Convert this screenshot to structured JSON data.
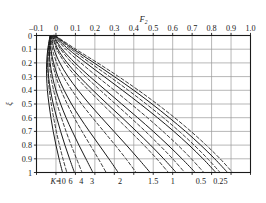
{
  "chart_data": {
    "type": "line",
    "title": "",
    "xlabel": "F2",
    "xlabel_display": "F",
    "xlabel_sub": "2",
    "ylabel": "ξ",
    "xlim": [
      -0.1,
      1.0
    ],
    "ylim": [
      0,
      1
    ],
    "y_inverted": true,
    "x_axis_position": "top",
    "grid": true,
    "legend": "none",
    "xticks": [
      -0.1,
      0,
      0.1,
      0.2,
      0.3,
      0.4,
      0.5,
      0.6,
      0.7,
      0.8,
      0.9,
      1.0
    ],
    "xtick_labels": [
      "-0.1",
      "0",
      "0.1",
      "0.2",
      "0.3",
      "0.4",
      "0.5",
      "0.6",
      "0.7",
      "0.8",
      "0.9",
      "1.0"
    ],
    "yticks": [
      0,
      0.1,
      0.2,
      0.3,
      0.4,
      0.5,
      0.6,
      0.7,
      0.8,
      0.9,
      1
    ],
    "ytick_labels": [
      "0",
      "0.1",
      "0.2",
      "0.3",
      "0.4",
      "0.5",
      "0.6",
      "0.7",
      "0.8",
      "0.9",
      "1"
    ],
    "curve_param_name": "K",
    "curve_param_prefix": "K=",
    "curve_labels": [
      "10",
      "6",
      "4",
      "3",
      "2",
      "1.5",
      "1",
      "0.5",
      "0.25"
    ],
    "curve_label_x": [
      0.03,
      0.075,
      0.13,
      0.185,
      0.33,
      0.5,
      0.6,
      0.745,
      0.845
    ],
    "linestyles": [
      "solid",
      "dashed"
    ],
    "series": [
      {
        "name": "K=10 solid",
        "style": "solid",
        "x": [
          -0.03,
          -0.042,
          -0.048,
          -0.048,
          -0.044,
          -0.036,
          -0.026,
          -0.014,
          0.0,
          0.016,
          0.034
        ],
        "y": [
          0.0,
          0.1,
          0.2,
          0.3,
          0.4,
          0.5,
          0.6,
          0.7,
          0.8,
          0.9,
          1.0
        ]
      },
      {
        "name": "K=10 dashed",
        "style": "dashed",
        "x": [
          -0.028,
          -0.038,
          -0.042,
          -0.04,
          -0.034,
          -0.024,
          -0.012,
          0.002,
          0.018,
          0.036,
          0.056
        ],
        "y": [
          0.0,
          0.1,
          0.2,
          0.3,
          0.4,
          0.5,
          0.6,
          0.7,
          0.8,
          0.9,
          1.0
        ]
      },
      {
        "name": "K=6 solid",
        "style": "solid",
        "x": [
          -0.03,
          -0.04,
          -0.042,
          -0.038,
          -0.028,
          -0.014,
          0.004,
          0.024,
          0.046,
          0.07,
          0.095
        ],
        "y": [
          0.0,
          0.1,
          0.2,
          0.3,
          0.4,
          0.5,
          0.6,
          0.7,
          0.8,
          0.9,
          1.0
        ]
      },
      {
        "name": "K=6 dashed",
        "style": "dashed",
        "x": [
          -0.028,
          -0.034,
          -0.034,
          -0.026,
          -0.012,
          0.006,
          0.028,
          0.052,
          0.078,
          0.106,
          0.134
        ],
        "y": [
          0.0,
          0.1,
          0.2,
          0.3,
          0.4,
          0.5,
          0.6,
          0.7,
          0.8,
          0.9,
          1.0
        ]
      },
      {
        "name": "K=4 solid",
        "style": "solid",
        "x": [
          -0.028,
          -0.034,
          -0.03,
          -0.018,
          0.0,
          0.024,
          0.052,
          0.084,
          0.118,
          0.154,
          0.19
        ],
        "y": [
          0.0,
          0.1,
          0.2,
          0.3,
          0.4,
          0.5,
          0.6,
          0.7,
          0.8,
          0.9,
          1.0
        ]
      },
      {
        "name": "K=4 dashed",
        "style": "dashed",
        "x": [
          -0.026,
          -0.028,
          -0.018,
          0.0,
          0.026,
          0.058,
          0.094,
          0.134,
          0.176,
          0.218,
          0.258
        ],
        "y": [
          0.0,
          0.1,
          0.2,
          0.3,
          0.4,
          0.5,
          0.6,
          0.7,
          0.8,
          0.9,
          1.0
        ]
      },
      {
        "name": "K=3 solid",
        "style": "solid",
        "x": [
          -0.026,
          -0.026,
          -0.012,
          0.01,
          0.042,
          0.08,
          0.124,
          0.172,
          0.222,
          0.272,
          0.32
        ],
        "y": [
          0.0,
          0.1,
          0.2,
          0.3,
          0.4,
          0.5,
          0.6,
          0.7,
          0.8,
          0.9,
          1.0
        ]
      },
      {
        "name": "K=3 dashed",
        "style": "dashed",
        "x": [
          -0.024,
          -0.018,
          0.004,
          0.038,
          0.082,
          0.132,
          0.188,
          0.246,
          0.304,
          0.36,
          0.412
        ],
        "y": [
          0.0,
          0.1,
          0.2,
          0.3,
          0.4,
          0.5,
          0.6,
          0.7,
          0.8,
          0.9,
          1.0
        ]
      },
      {
        "name": "K=2 solid",
        "style": "solid",
        "x": [
          -0.022,
          -0.01,
          0.02,
          0.062,
          0.114,
          0.172,
          0.234,
          0.298,
          0.362,
          0.424,
          0.484
        ],
        "y": [
          0.0,
          0.1,
          0.2,
          0.3,
          0.4,
          0.5,
          0.6,
          0.7,
          0.8,
          0.9,
          1.0
        ]
      },
      {
        "name": "K=2 dashed",
        "style": "dashed",
        "x": [
          -0.02,
          0.004,
          0.046,
          0.102,
          0.168,
          0.238,
          0.31,
          0.382,
          0.452,
          0.518,
          0.578
        ],
        "y": [
          0.0,
          0.1,
          0.2,
          0.3,
          0.4,
          0.5,
          0.6,
          0.7,
          0.8,
          0.9,
          1.0
        ]
      },
      {
        "name": "K=1.5 solid",
        "style": "solid",
        "x": [
          -0.018,
          0.01,
          0.058,
          0.12,
          0.19,
          0.264,
          0.34,
          0.414,
          0.486,
          0.554,
          0.618
        ],
        "y": [
          0.0,
          0.1,
          0.2,
          0.3,
          0.4,
          0.5,
          0.6,
          0.7,
          0.8,
          0.9,
          1.0
        ]
      },
      {
        "name": "K=1.5 dashed",
        "style": "dashed",
        "x": [
          -0.016,
          0.024,
          0.082,
          0.152,
          0.228,
          0.306,
          0.384,
          0.46,
          0.532,
          0.6,
          0.662
        ],
        "y": [
          0.0,
          0.1,
          0.2,
          0.3,
          0.4,
          0.5,
          0.6,
          0.7,
          0.8,
          0.9,
          1.0
        ]
      },
      {
        "name": "K=1 solid",
        "style": "solid",
        "x": [
          -0.014,
          0.032,
          0.098,
          0.174,
          0.256,
          0.338,
          0.42,
          0.5,
          0.576,
          0.648,
          0.716
        ],
        "y": [
          0.0,
          0.1,
          0.2,
          0.3,
          0.4,
          0.5,
          0.6,
          0.7,
          0.8,
          0.9,
          1.0
        ]
      },
      {
        "name": "K=1 dashed",
        "style": "dashed",
        "x": [
          -0.012,
          0.05,
          0.128,
          0.212,
          0.3,
          0.386,
          0.47,
          0.55,
          0.626,
          0.696,
          0.76
        ],
        "y": [
          0.0,
          0.1,
          0.2,
          0.3,
          0.4,
          0.5,
          0.6,
          0.7,
          0.8,
          0.9,
          1.0
        ]
      },
      {
        "name": "K=0.5 solid",
        "style": "solid",
        "x": [
          -0.01,
          0.064,
          0.154,
          0.248,
          0.342,
          0.434,
          0.522,
          0.606,
          0.684,
          0.756,
          0.822
        ],
        "y": [
          0.0,
          0.1,
          0.2,
          0.3,
          0.4,
          0.5,
          0.6,
          0.7,
          0.8,
          0.9,
          1.0
        ]
      },
      {
        "name": "K=0.5 dashed",
        "style": "dashed",
        "x": [
          -0.008,
          0.078,
          0.176,
          0.276,
          0.372,
          0.464,
          0.552,
          0.634,
          0.71,
          0.78,
          0.844
        ],
        "y": [
          0.0,
          0.1,
          0.2,
          0.3,
          0.4,
          0.5,
          0.6,
          0.7,
          0.8,
          0.9,
          1.0
        ]
      },
      {
        "name": "K=0.25 solid",
        "style": "solid",
        "x": [
          -0.006,
          0.09,
          0.196,
          0.3,
          0.4,
          0.494,
          0.582,
          0.666,
          0.744,
          0.816,
          0.882
        ],
        "y": [
          0.0,
          0.1,
          0.2,
          0.3,
          0.4,
          0.5,
          0.6,
          0.7,
          0.8,
          0.9,
          1.0
        ]
      },
      {
        "name": "K=0.25 dashed",
        "style": "dashed",
        "x": [
          -0.004,
          0.102,
          0.214,
          0.322,
          0.424,
          0.52,
          0.61,
          0.694,
          0.772,
          0.844,
          0.908
        ],
        "y": [
          0.0,
          0.1,
          0.2,
          0.3,
          0.4,
          0.5,
          0.6,
          0.7,
          0.8,
          0.9,
          1.0
        ]
      }
    ],
    "colors": {
      "line": "#1a1a1a",
      "grid": "#9a9a9a",
      "axis": "#1a1a1a",
      "background": "#ffffff"
    }
  }
}
